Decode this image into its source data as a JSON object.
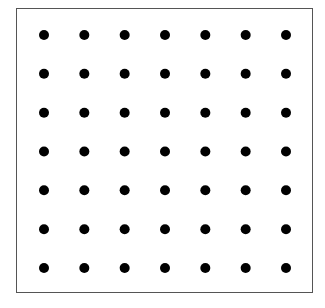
{
  "diagram": {
    "type": "dot-grid",
    "rows": 7,
    "cols": 7,
    "x_start": 44,
    "x_end": 286,
    "y_start": 35,
    "y_end": 268,
    "dot_radius": 5,
    "dot_color": "#000000",
    "border_color": "#555555"
  }
}
